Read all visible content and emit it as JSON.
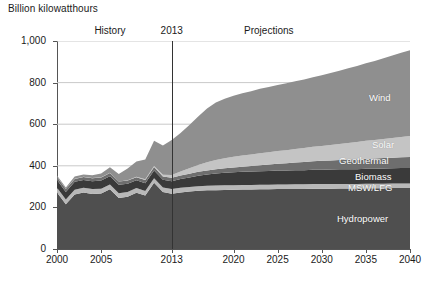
{
  "chart_data": {
    "type": "area",
    "title": "",
    "ylabel": "Billion kilowatthours",
    "xlabel": "",
    "ylim": [
      0,
      1000
    ],
    "xlim": [
      2000,
      2040
    ],
    "grid": true,
    "stacked": true,
    "legend_position": "inline-right",
    "y_ticks": [
      "0",
      "200",
      "400",
      "600",
      "800",
      "1,000"
    ],
    "y_tick_values": [
      0,
      200,
      400,
      600,
      800,
      1000
    ],
    "x_ticks": [
      "2000",
      "2005",
      "2013",
      "2020",
      "2025",
      "2030",
      "2035",
      "2040"
    ],
    "x_tick_values": [
      2000,
      2005,
      2013,
      2020,
      2025,
      2030,
      2035,
      2040
    ],
    "annotations": [
      {
        "name": "history",
        "text": "History",
        "x": 2006
      },
      {
        "name": "divider-year",
        "text": "2013",
        "x": 2013
      },
      {
        "name": "projections",
        "text": "Projections",
        "x": 2024
      }
    ],
    "divider_x": 2013,
    "x": [
      2000,
      2001,
      2002,
      2003,
      2004,
      2005,
      2006,
      2007,
      2008,
      2009,
      2010,
      2011,
      2012,
      2013,
      2014,
      2015,
      2016,
      2017,
      2018,
      2019,
      2020,
      2021,
      2022,
      2023,
      2024,
      2025,
      2026,
      2027,
      2028,
      2029,
      2030,
      2031,
      2032,
      2033,
      2034,
      2035,
      2036,
      2037,
      2038,
      2039,
      2040
    ],
    "series": [
      {
        "name": "Hydropower",
        "color": "#4f4f4f",
        "values": [
          272,
          215,
          262,
          272,
          265,
          267,
          287,
          245,
          251,
          271,
          257,
          318,
          274,
          266,
          272,
          276,
          280,
          282,
          283,
          284,
          285,
          286,
          286,
          287,
          287,
          288,
          288,
          289,
          289,
          290,
          290,
          290,
          291,
          291,
          291,
          292,
          292,
          292,
          293,
          293,
          293
        ]
      },
      {
        "name": "MSW/LFG",
        "color": "#b8b8b8",
        "values": [
          23,
          23,
          23,
          23,
          23,
          23,
          23,
          23,
          23,
          22,
          22,
          22,
          22,
          22,
          22,
          22,
          22,
          22,
          22,
          22,
          22,
          22,
          22,
          22,
          22,
          22,
          22,
          22,
          22,
          22,
          22,
          22,
          22,
          22,
          22,
          22,
          22,
          22,
          22,
          22,
          22
        ]
      },
      {
        "name": "Biomass",
        "color": "#3a3a3a",
        "values": [
          37,
          36,
          38,
          37,
          38,
          39,
          40,
          41,
          40,
          37,
          37,
          38,
          37,
          38,
          42,
          46,
          50,
          54,
          58,
          60,
          62,
          63,
          64,
          65,
          66,
          67,
          67,
          68,
          68,
          69,
          69,
          70,
          70,
          71,
          71,
          72,
          72,
          73,
          73,
          74,
          74
        ]
      },
      {
        "name": "Geothermal",
        "color": "#6e6e6e",
        "values": [
          14,
          14,
          14,
          14,
          14,
          15,
          15,
          15,
          15,
          15,
          16,
          16,
          16,
          17,
          17,
          18,
          19,
          20,
          21,
          22,
          23,
          25,
          27,
          29,
          31,
          33,
          35,
          37,
          39,
          41,
          43,
          44,
          45,
          46,
          47,
          48,
          49,
          50,
          51,
          52,
          53
        ]
      },
      {
        "name": "Solar",
        "color": "#c4c4c4",
        "values": [
          1,
          1,
          1,
          1,
          1,
          1,
          1,
          1,
          2,
          2,
          3,
          5,
          8,
          13,
          19,
          26,
          33,
          39,
          44,
          48,
          51,
          53,
          55,
          57,
          59,
          61,
          63,
          65,
          67,
          69,
          71,
          74,
          77,
          80,
          83,
          86,
          89,
          92,
          95,
          98,
          101
        ]
      },
      {
        "name": "Wind",
        "color": "#8f8f8f",
        "values": [
          6,
          7,
          10,
          11,
          14,
          18,
          27,
          35,
          56,
          74,
          95,
          121,
          141,
          168,
          186,
          208,
          233,
          258,
          276,
          286,
          294,
          300,
          305,
          310,
          314,
          318,
          322,
          326,
          330,
          335,
          340,
          346,
          352,
          359,
          366,
          373,
          380,
          388,
          396,
          404,
          412
        ]
      }
    ],
    "totals_key_points": [
      {
        "year": 2000,
        "total": 353
      },
      {
        "year": 2001,
        "total": 296
      },
      {
        "year": 2009,
        "total": 421
      },
      {
        "year": 2013,
        "total": 524
      },
      {
        "year": 2020,
        "total": 737
      },
      {
        "year": 2030,
        "total": 817
      },
      {
        "year": 2040,
        "total": 955
      }
    ]
  }
}
